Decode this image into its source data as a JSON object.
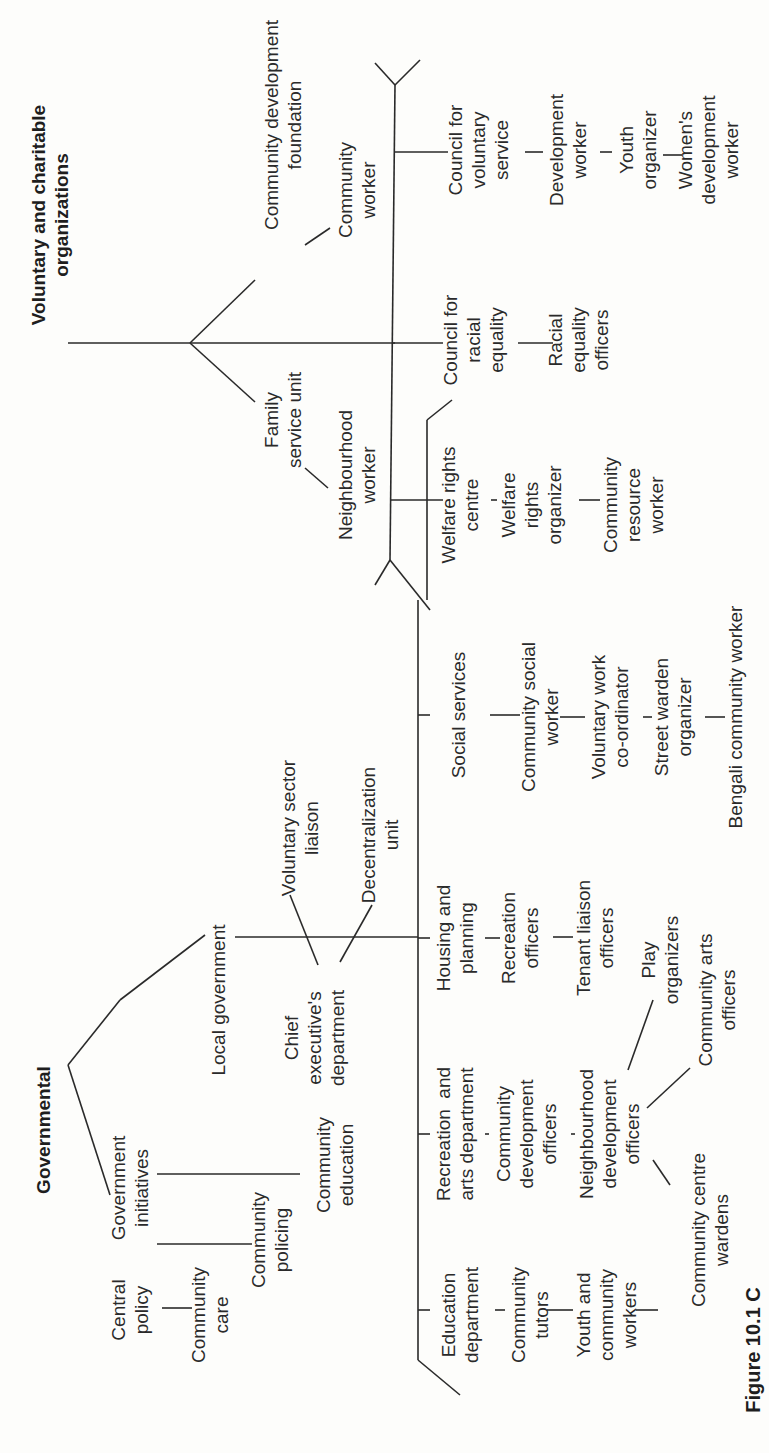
{
  "figure": {
    "orientation": "rotated-90-ccw",
    "caption_fragment": "Figure 10.1  C"
  },
  "voluntary": {
    "title_line1": "Voluntary and charitable",
    "title_line2": "organizations",
    "branches": {
      "cdf": {
        "l1": "Community development",
        "l2": "foundation"
      },
      "cdf_child": {
        "l1": "Community",
        "l2": "worker"
      },
      "fsu": {
        "l1": "Family",
        "l2": "service unit"
      },
      "fsu_child": {
        "l1": "Neighbourhood",
        "l2": "worker"
      }
    },
    "orgs": {
      "cvs": {
        "l1": "Council for",
        "l2": "voluntary",
        "l3": "service"
      },
      "cvs_c1": {
        "l1": "Development",
        "l2": "worker"
      },
      "cvs_c2": {
        "l1": "Youth",
        "l2": "organizer"
      },
      "cvs_c3": {
        "l1": "Women's",
        "l2": "development",
        "l3": "worker"
      },
      "cre": {
        "l1": "Council for",
        "l2": "racial",
        "l3": "equality"
      },
      "cre_c1": {
        "l1": "Racial",
        "l2": "equality",
        "l3": "officers"
      },
      "wrc": {
        "l1": "Welfare rights",
        "l2": "centre"
      },
      "wrc_c1": {
        "l1": "Welfare",
        "l2": "rights",
        "l3": "organizer"
      },
      "wrc_c2": {
        "l1": "Community",
        "l2": "resource",
        "l3": "worker"
      }
    }
  },
  "governmental": {
    "title": "Governmental",
    "initiatives": {
      "label": {
        "l1": "Government",
        "l2": "initiatives"
      },
      "central": {
        "l1": "Central",
        "l2": "policy"
      },
      "care": {
        "l1": "Community",
        "l2": "care"
      },
      "policing": {
        "l1": "Community",
        "l2": "policing"
      },
      "education": {
        "l1": "Community",
        "l2": "education"
      }
    },
    "local": {
      "label": "Local government",
      "chief": {
        "l1": "Chief",
        "l2": "executive's",
        "l3": "department"
      },
      "vsl": {
        "l1": "Voluntary sector",
        "l2": "liaison"
      },
      "decent": {
        "l1": "Decentralization",
        "l2": "unit"
      },
      "social": {
        "l1": "Social services"
      },
      "social_c1": {
        "l1": "Community social",
        "l2": "worker"
      },
      "social_c2": {
        "l1": "Voluntary work",
        "l2": "co-ordinator"
      },
      "social_c3": {
        "l1": "Street warden",
        "l2": "organizer"
      },
      "social_c4": {
        "l1": "Bengali community worker"
      },
      "housing": {
        "l1": "Housing and",
        "l2": "planning"
      },
      "housing_c1": {
        "l1": "Recreation",
        "l2": "officers"
      },
      "housing_c2": {
        "l1": "Tenant liaison",
        "l2": "officers"
      },
      "recarts": {
        "l1": "Recreation  and",
        "l2": "arts department"
      },
      "recarts_c1": {
        "l1": "Community",
        "l2": "development",
        "l3": "officers"
      },
      "recarts_c2": {
        "l1": "Neighbourhood",
        "l2": "development",
        "l3": "officers"
      },
      "play": {
        "l1": "Play",
        "l2": "organizers"
      },
      "arts": {
        "l1": "Community arts",
        "l2": "officers"
      },
      "wardens": {
        "l1": "Community centre",
        "l2": "wardens"
      },
      "edu": {
        "l1": "Education",
        "l2": "department"
      },
      "edu_c1": {
        "l1": "Community",
        "l2": "tutors"
      },
      "edu_c2": {
        "l1": "Youth and",
        "l2": "community",
        "l3": "workers"
      },
      "edu_c3": {
        "l1": "Community centre",
        "l2": "wardens"
      }
    }
  }
}
